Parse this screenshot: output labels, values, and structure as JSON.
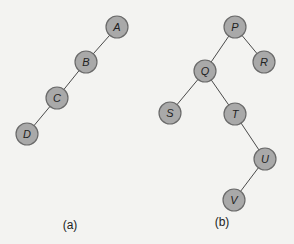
{
  "figures": [
    {
      "caption": "(a)",
      "nodes": [
        "A",
        "B",
        "C",
        "D"
      ],
      "edges": [
        [
          "A",
          "B"
        ],
        [
          "B",
          "C"
        ],
        [
          "C",
          "D"
        ]
      ]
    },
    {
      "caption": "(b)",
      "nodes": [
        "P",
        "Q",
        "R",
        "S",
        "T",
        "U",
        "V"
      ],
      "edges": [
        [
          "P",
          "Q"
        ],
        [
          "P",
          "R"
        ],
        [
          "Q",
          "S"
        ],
        [
          "Q",
          "T"
        ],
        [
          "T",
          "U"
        ],
        [
          "U",
          "V"
        ]
      ]
    }
  ],
  "colors": {
    "node_fill": "#a9a9a9",
    "node_stroke": "#6a6a6a",
    "edge": "#4a4a4a",
    "background": "#f3f3f1"
  }
}
